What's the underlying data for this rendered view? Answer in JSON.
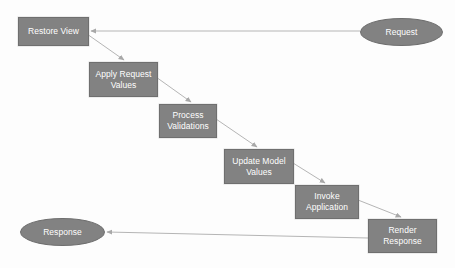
{
  "diagram": {
    "type": "flow-diagram",
    "background_color": "#fdfdfd",
    "node_fill_color": "#828282",
    "node_border_color": "#6f6f6f",
    "node_text_color": "#ffffff",
    "edge_color": "#b5b5b5",
    "nodes": [
      {
        "id": "request",
        "label": "Request",
        "shape": "ellipse",
        "x": 360,
        "y": 18,
        "w": 83,
        "h": 28
      },
      {
        "id": "restore-view",
        "label": "Restore View",
        "shape": "box",
        "x": 18,
        "y": 17,
        "w": 71,
        "h": 29
      },
      {
        "id": "apply-request-values",
        "label": "Apply Request\nValues",
        "shape": "box",
        "x": 89,
        "y": 62,
        "w": 69,
        "h": 35
      },
      {
        "id": "process-validations",
        "label": "Process\nValidations",
        "shape": "box",
        "x": 159,
        "y": 104,
        "w": 58,
        "h": 34
      },
      {
        "id": "update-model-values",
        "label": "Update Model\nValues",
        "shape": "box",
        "x": 224,
        "y": 149,
        "w": 70,
        "h": 35
      },
      {
        "id": "invoke-application",
        "label": "Invoke\nApplication",
        "shape": "box",
        "x": 295,
        "y": 185,
        "w": 64,
        "h": 34
      },
      {
        "id": "render-response",
        "label": "Render\nResponse",
        "shape": "box",
        "x": 368,
        "y": 219,
        "w": 69,
        "h": 34
      },
      {
        "id": "response",
        "label": "Response",
        "shape": "ellipse",
        "x": 20,
        "y": 218,
        "w": 85,
        "h": 28
      }
    ],
    "edges": [
      {
        "id": "request-to-restore-view",
        "from": "request",
        "to": "restore-view",
        "points": "360,31 91,31",
        "arrow": true
      },
      {
        "id": "restore-view-to-apply-request-values",
        "from": "restore-view",
        "to": "apply-request-values",
        "points": "87,34 124,60",
        "arrow": true
      },
      {
        "id": "apply-request-values-to-process-validations",
        "from": "apply-request-values",
        "to": "process-validations",
        "points": "156,77 191,102",
        "arrow": true
      },
      {
        "id": "process-validations-to-update-model-values",
        "from": "process-validations",
        "to": "update-model-values",
        "points": "216,119 257,147",
        "arrow": true
      },
      {
        "id": "update-model-values-to-invoke-application",
        "from": "update-model-values",
        "to": "invoke-application",
        "points": "293,163 325,183",
        "arrow": true
      },
      {
        "id": "invoke-application-to-render-response",
        "from": "invoke-application",
        "to": "render-response",
        "points": "358,200 401,217",
        "arrow": true
      },
      {
        "id": "render-response-to-response",
        "from": "render-response",
        "to": "response",
        "points": "368,238 107,232",
        "arrow": true
      }
    ]
  }
}
